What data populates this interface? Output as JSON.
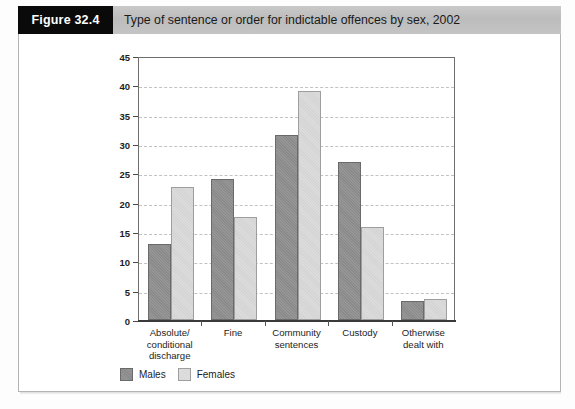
{
  "figure": {
    "number_label": "Figure 32.4",
    "title": "Type of sentence or order for indictable offences by sex, 2002"
  },
  "legend": {
    "position": "bottom-left",
    "entries": [
      {
        "label": "Males",
        "color": "#8a8a8a"
      },
      {
        "label": "Females",
        "color": "#dcdcdc"
      }
    ]
  },
  "chart_data": {
    "type": "bar",
    "title": "Type of sentence or order for indictable offences by sex, 2002",
    "xlabel": "",
    "ylabel": "Percentage",
    "ylim": [
      0,
      45
    ],
    "yticks": [
      0,
      5,
      10,
      15,
      20,
      25,
      30,
      35,
      40,
      45
    ],
    "ytick_labels": [
      "0",
      "5",
      "10",
      "15",
      "20",
      "25",
      "30",
      "35",
      "40",
      "45"
    ],
    "grid": true,
    "grid_axis": "y",
    "legend_position": "bottom-left",
    "categories": [
      "Absolute/ conditional discharge",
      "Fine",
      "Community sentences",
      "Custody",
      "Otherwise dealt with"
    ],
    "category_lines": [
      [
        "Absolute/",
        "conditional",
        "discharge"
      ],
      [
        "Fine"
      ],
      [
        "Community",
        "sentences"
      ],
      [
        "Custody"
      ],
      [
        "Otherwise",
        "dealt with"
      ]
    ],
    "series": [
      {
        "name": "Males",
        "color": "#8a8a8a",
        "values": [
          13.0,
          24.0,
          31.5,
          27.0,
          3.3
        ]
      },
      {
        "name": "Females",
        "color": "#dcdcdc",
        "values": [
          22.7,
          17.6,
          39.0,
          15.8,
          3.6
        ]
      }
    ]
  }
}
